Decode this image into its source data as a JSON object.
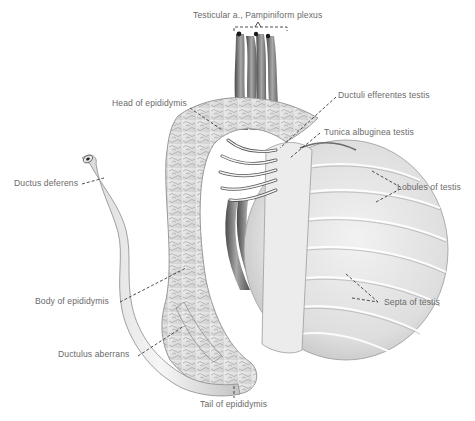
{
  "figure": {
    "labels": [
      {
        "id": "testicular-artery",
        "text": "Testicular a., Pampiniform plexus"
      },
      {
        "id": "head-of-epididymis",
        "text": "Head of epididymis"
      },
      {
        "id": "ductuli-efferentes",
        "text": "Ductuli efferentes testis"
      },
      {
        "id": "tunica-albuginea",
        "text": "Tunica albuginea testis"
      },
      {
        "id": "ductus-deferens",
        "text": "Ductus deferens"
      },
      {
        "id": "lobules-of-testis",
        "text": "Lobules of testis"
      },
      {
        "id": "body-of-epididymis",
        "text": "Body of epididymis"
      },
      {
        "id": "septa-of-testis",
        "text": "Septa of testis"
      },
      {
        "id": "ductulus-aberrans",
        "text": "Ductulus aberrans"
      },
      {
        "id": "tail-of-epididymis",
        "text": "Tail of epididymis"
      }
    ]
  }
}
